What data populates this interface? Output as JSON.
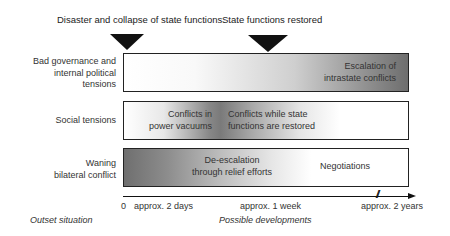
{
  "events": [
    {
      "label": "Disaster and collapse of state functions"
    },
    {
      "label": "State functions restored"
    }
  ],
  "rows": [
    {
      "label_lines": [
        "Bad governance and",
        "internal political",
        "tensions"
      ],
      "box_texts": [
        {
          "lines": [
            "Escalation of",
            "intrastate conflicts"
          ]
        }
      ]
    },
    {
      "label_lines": [
        "Social tensions"
      ],
      "box_texts": [
        {
          "lines": [
            "Conflicts in",
            "power vacuums"
          ]
        },
        {
          "lines": [
            "Conflicts while state",
            "functions are restored"
          ]
        }
      ]
    },
    {
      "label_lines": [
        "Waning",
        "bilateral conflict"
      ],
      "box_texts": [
        {
          "lines": [
            "De-escalation",
            "through relief efforts"
          ]
        },
        {
          "lines": [
            "Negotiations"
          ]
        }
      ]
    }
  ],
  "axis": {
    "ticks": [
      "0",
      "approx. 2 days",
      "approx. 1 week",
      "approx. 2 years"
    ],
    "break_symbol": "//"
  },
  "footer": {
    "left": "Outset situation",
    "center": "Possible developments"
  }
}
